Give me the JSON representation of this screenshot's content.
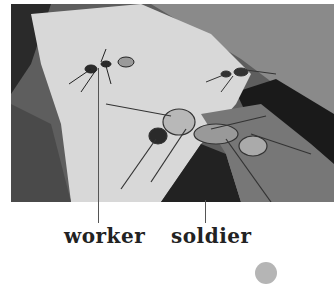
{
  "figure": {
    "labels": [
      {
        "text": "worker"
      },
      {
        "text": "soldier"
      }
    ]
  }
}
